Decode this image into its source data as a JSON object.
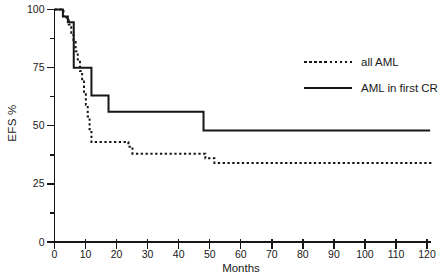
{
  "colors": {
    "curve": "#161616",
    "text": "#1a1a1a",
    "background": "#ffffff"
  },
  "chart_data": {
    "type": "line",
    "subtype": "step-survival",
    "title": "",
    "xlabel": "Months",
    "ylabel": "EFS %",
    "xlim": [
      0,
      120
    ],
    "ylim": [
      0,
      100
    ],
    "grid": false,
    "legend_position": "upper-right",
    "x_ticks": [
      0,
      10,
      20,
      30,
      40,
      50,
      60,
      70,
      80,
      90,
      100,
      110,
      120
    ],
    "y_ticks": [
      0,
      25,
      50,
      75,
      100
    ],
    "y_minor_ticks": [
      12.5,
      37.5,
      62.5,
      87.5
    ],
    "series": [
      {
        "name": "all AML",
        "style": "dotted",
        "end_month": 122,
        "steps": [
          [
            0,
            100
          ],
          [
            2.9,
            96.5
          ],
          [
            4.6,
            93.5
          ],
          [
            5.4,
            90
          ],
          [
            6.1,
            86
          ],
          [
            6.8,
            82
          ],
          [
            7.5,
            78
          ],
          [
            8.2,
            73.5
          ],
          [
            8.9,
            69
          ],
          [
            9.5,
            64
          ],
          [
            10.1,
            59
          ],
          [
            10.7,
            54
          ],
          [
            11.3,
            48.5
          ],
          [
            11.9,
            43
          ],
          [
            23.8,
            41
          ],
          [
            25.1,
            38
          ],
          [
            48.6,
            36
          ],
          [
            51.5,
            34
          ]
        ]
      },
      {
        "name": "AML in first CR",
        "style": "solid",
        "end_month": 121,
        "steps": [
          [
            0,
            100
          ],
          [
            2.7,
            97
          ],
          [
            4.3,
            94.5
          ],
          [
            6.2,
            75
          ],
          [
            11.9,
            63
          ],
          [
            17.4,
            56
          ],
          [
            48,
            48
          ]
        ]
      }
    ]
  }
}
